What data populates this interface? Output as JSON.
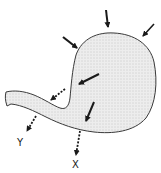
{
  "diagram": {
    "type": "anatomical-schematic",
    "colors": {
      "outline": "#3a3a3a",
      "fill": "#e4e4e4",
      "arrow": "#1a1a1a"
    },
    "labels": {
      "x": "X",
      "y": "Y"
    },
    "arrows": [
      {
        "id": "top",
        "style": "solid",
        "direction": "inward"
      },
      {
        "id": "top-left",
        "style": "solid",
        "direction": "inward"
      },
      {
        "id": "top-right",
        "style": "solid",
        "direction": "inward"
      },
      {
        "id": "inner-upper",
        "style": "solid",
        "direction": "toward-outlet"
      },
      {
        "id": "outlet",
        "style": "dotted",
        "direction": "outward"
      },
      {
        "id": "inner-lower",
        "style": "solid",
        "direction": "downward"
      },
      {
        "id": "to-y",
        "style": "dotted",
        "direction": "outward",
        "label": "Y"
      },
      {
        "id": "to-x",
        "style": "dotted",
        "direction": "outward",
        "label": "X"
      }
    ]
  }
}
